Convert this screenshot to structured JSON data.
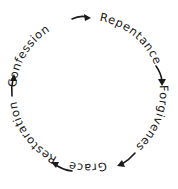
{
  "diagram": {
    "type": "cycle",
    "direction": "clockwise",
    "colors": {
      "text": "#1a1a1a",
      "arrows": "#1a1a1a",
      "background": "#ffffff"
    },
    "stages": [
      {
        "label": "Confession"
      },
      {
        "label": "Repentance"
      },
      {
        "label": "Forgivenes"
      },
      {
        "label": "Grace"
      },
      {
        "label": "Restoration"
      }
    ],
    "arrows": [
      {
        "from": "Confession",
        "to": "Repentance",
        "icon": "curved-arrow-right-icon"
      },
      {
        "from": "Repentance",
        "to": "Forgivenes",
        "icon": "curved-arrow-down-icon"
      },
      {
        "from": "Forgivenes",
        "to": "Grace",
        "icon": "curved-arrow-down-left-icon"
      },
      {
        "from": "Grace",
        "to": "Restoration",
        "icon": "curved-arrow-left-icon"
      },
      {
        "from": "Restoration",
        "to": "Confession",
        "icon": "curved-arrow-up-icon"
      }
    ]
  }
}
